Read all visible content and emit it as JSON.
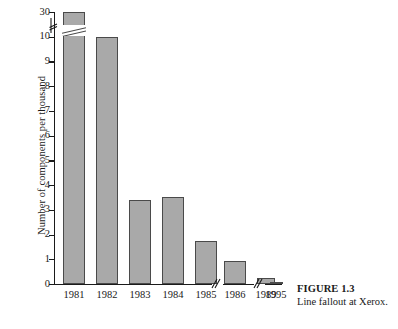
{
  "chart_data": {
    "type": "bar",
    "title": "",
    "xlabel": "",
    "ylabel": "Number of components per thousand",
    "categories": [
      "1981",
      "1982",
      "1983",
      "1984",
      "1985",
      "1986",
      "1989",
      "1995"
    ],
    "values": [
      30,
      10,
      3.4,
      3.5,
      1.75,
      0.95,
      0.25,
      0.06
    ],
    "ylim": [
      0,
      11
    ],
    "ytick_labels": [
      "0",
      "1",
      "2",
      "3",
      "4",
      "5",
      "6",
      "7",
      "8",
      "9",
      "10",
      "30"
    ],
    "ytick_values": [
      0,
      1,
      2,
      3,
      4,
      5,
      6,
      7,
      8,
      9,
      10,
      11
    ],
    "grid": false,
    "legend": null,
    "axis_breaks": {
      "y": "Y axis is broken between 10 and 30",
      "x": "X axis is broken between 1986 and 1989, and between 1989 and 1995"
    },
    "bar_fill_color": "#a9a9a9",
    "bar_edge_color": "#4a4a4a",
    "axis_color": "#1a1a1a",
    "background_color": "#ffffff"
  },
  "caption": {
    "title": "FIGURE 1.3",
    "text": "Line fallout at Xerox."
  }
}
